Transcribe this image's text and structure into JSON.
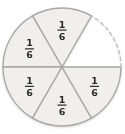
{
  "chart_data": {
    "type": "pie",
    "title": "",
    "total_parts": 6,
    "shaded_parts": 5,
    "unshaded_parts": 1,
    "unit_fraction": {
      "numerator": "1",
      "denominator": "6"
    },
    "slices": [
      {
        "position": "top-center",
        "start_deg": 60,
        "end_deg": 120,
        "shaded": true,
        "dashed_arc": false,
        "label_numerator": "1",
        "label_denominator": "6"
      },
      {
        "position": "top-left",
        "start_deg": 120,
        "end_deg": 180,
        "shaded": true,
        "dashed_arc": false,
        "label_numerator": "1",
        "label_denominator": "6"
      },
      {
        "position": "bottom-left",
        "start_deg": 180,
        "end_deg": 240,
        "shaded": true,
        "dashed_arc": false,
        "label_numerator": "1",
        "label_denominator": "6"
      },
      {
        "position": "bottom-center",
        "start_deg": 240,
        "end_deg": 300,
        "shaded": true,
        "dashed_arc": false,
        "label_numerator": "1",
        "label_denominator": "6"
      },
      {
        "position": "bottom-right",
        "start_deg": 300,
        "end_deg": 360,
        "shaded": true,
        "dashed_arc": false,
        "label_numerator": "1",
        "label_denominator": "6"
      },
      {
        "position": "top-right",
        "start_deg": 0,
        "end_deg": 60,
        "shaded": false,
        "dashed_arc": true,
        "label_numerator": "",
        "label_denominator": ""
      }
    ],
    "colors": {
      "shaded_fill": "#f0efec",
      "sector_stroke": "#a9a8a5",
      "dashed_stroke": "#bdbcb8",
      "label_text": "#2b2b2b",
      "background": "#ffffff"
    },
    "layout": {
      "legend": "none",
      "grid": "off"
    }
  }
}
